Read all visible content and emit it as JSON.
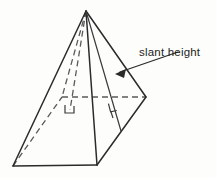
{
  "figure": {
    "name": "square-pyramid-slant-height-diagram",
    "background_color": "#fdfdfb",
    "line_color": "#2b2b2b",
    "hidden_line_color": "#5a5a5a",
    "annotations": {
      "slant_height_label": "slant height"
    },
    "geometry": {
      "apex": [
        86,
        11
      ],
      "base_front": [
        97,
        165
      ],
      "base_left": [
        13,
        166
      ],
      "base_right": [
        146,
        97
      ],
      "base_back": [
        62,
        97
      ],
      "height_foot": [
        70,
        110
      ],
      "slant_foot": [
        121,
        131
      ],
      "right_angle_marks": 2
    },
    "leader": {
      "from": [
        178,
        52
      ],
      "to": [
        117,
        73
      ],
      "arrow_at": [
        117,
        73
      ]
    }
  }
}
